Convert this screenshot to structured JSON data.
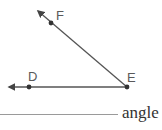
{
  "diagram": {
    "points": [
      {
        "name": "F",
        "label": "F"
      },
      {
        "name": "E",
        "label": "E"
      },
      {
        "name": "D",
        "label": "D"
      }
    ],
    "rays": [
      {
        "from": "E",
        "through": "F"
      },
      {
        "from": "E",
        "through": "D"
      }
    ],
    "vertex": "E",
    "colors": {
      "line": "#555555",
      "point": "#333333",
      "label": "#5a5a5a"
    }
  },
  "answer": {
    "blank": "",
    "suffix": "angle"
  }
}
